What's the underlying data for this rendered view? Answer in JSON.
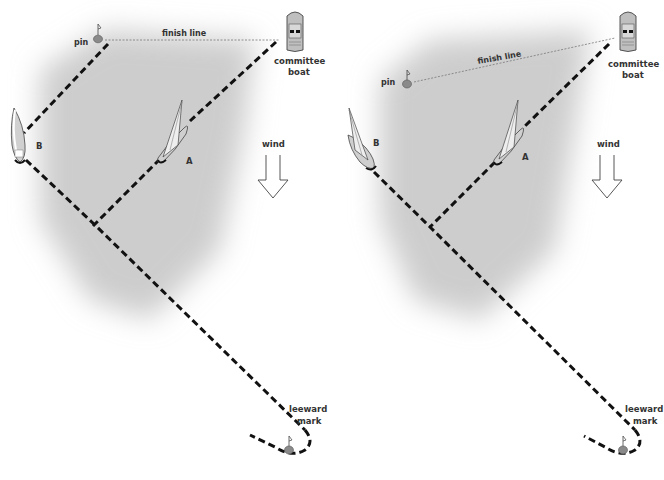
{
  "diagrams": [
    {
      "id": "left",
      "labels": {
        "pin": "pin",
        "finish_line": "finish line",
        "committee_line1": "committee",
        "committee_line2": "boat",
        "boat_a": "A",
        "boat_b": "B",
        "wind": "wind",
        "leeward_line1": "leeward",
        "leeward_line2": "mark"
      }
    },
    {
      "id": "right",
      "labels": {
        "pin": "pin",
        "finish_line": "finish line",
        "committee_line1": "committee",
        "committee_line2": "boat",
        "boat_a": "A",
        "boat_b": "B",
        "wind": "wind",
        "leeward_line1": "leeward",
        "leeward_line2": "mark"
      }
    }
  ],
  "colors": {
    "background": "#ffffff",
    "shade": "#bdbdbd",
    "path": "#111111",
    "finish_line": "#777777",
    "mark": "#8a8a8a",
    "text": "#333333"
  }
}
